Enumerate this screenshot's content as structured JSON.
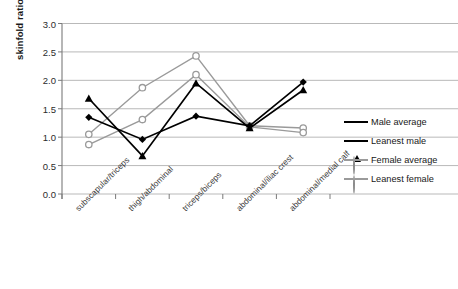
{
  "chart_data": {
    "type": "line",
    "title": "",
    "xlabel": "",
    "ylabel": "skinfold ratio",
    "ylim": [
      0.0,
      3.0
    ],
    "ytick_values": [
      0.0,
      0.5,
      1.0,
      1.5,
      2.0,
      2.5,
      3.0
    ],
    "ytick_labels": [
      "0.0",
      "0.5",
      "1.0",
      "1.5",
      "2.0",
      "2.5",
      "3.0"
    ],
    "grid": true,
    "legend_position": "right",
    "categories": [
      "subscapular/triceps",
      "thigh/abdominal",
      "triceps/biceps",
      "abdominal/iliac crest",
      "abdominal/medial calf"
    ],
    "series": [
      {
        "name": "Male average",
        "color": "#000000",
        "marker": "filled-diamond",
        "values": [
          1.35,
          0.96,
          1.37,
          1.2,
          1.97
        ]
      },
      {
        "name": "Leanest male",
        "color": "#000000",
        "marker": "filled-triangle",
        "values": [
          1.68,
          0.67,
          1.95,
          1.16,
          1.83
        ]
      },
      {
        "name": "Female average",
        "color": "#9a9a9a",
        "marker": "open-circle",
        "values": [
          1.05,
          1.87,
          2.43,
          1.2,
          1.16
        ]
      },
      {
        "name": "Leanest female",
        "color": "#9a9a9a",
        "marker": "open-circle",
        "values": [
          0.87,
          1.31,
          2.1,
          1.18,
          1.08
        ]
      }
    ]
  },
  "axis": {
    "y_title": "skinfold ratio"
  },
  "legend": {
    "entries": [
      {
        "label": "Male average"
      },
      {
        "label": "Leanest male"
      },
      {
        "label": "Female average"
      },
      {
        "label": "Leanest female"
      }
    ]
  }
}
